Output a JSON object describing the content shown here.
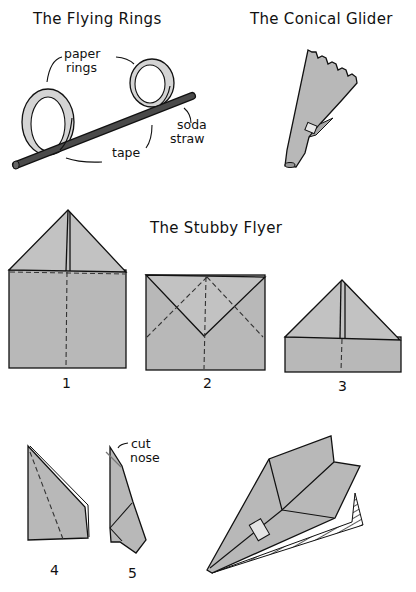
{
  "sections": {
    "flying_rings": {
      "title": "The Flying Rings",
      "labels": {
        "paper_rings_line1": "paper",
        "paper_rings_line2": "rings",
        "soda_straw_line1": "soda",
        "soda_straw_line2": "straw",
        "tape": "tape"
      }
    },
    "conical_glider": {
      "title": "The Conical Glider"
    },
    "stubby_flyer": {
      "title": "The Stubby Flyer",
      "steps": [
        {
          "number": "1"
        },
        {
          "number": "2"
        },
        {
          "number": "3"
        },
        {
          "number": "4"
        },
        {
          "number": "5"
        }
      ],
      "annotations": {
        "cut_nose_line1": "cut",
        "cut_nose_line2": "nose"
      }
    }
  },
  "colors": {
    "paper_fill": "#b4b4b4",
    "paper_light": "#dcdcdc",
    "straw_fill": "#4a4a4a",
    "ink": "#111111",
    "background": "#ffffff"
  }
}
